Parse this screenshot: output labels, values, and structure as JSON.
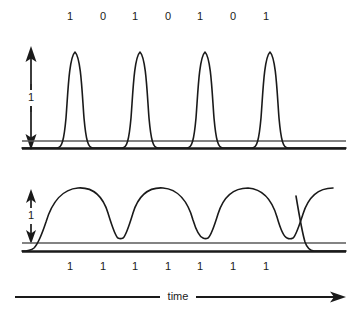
{
  "diagram": {
    "axis": {
      "time_label": "time",
      "time_arrow_icon": "right-arrow-icon"
    },
    "signals": [
      {
        "id": "upper",
        "name": "return-to-zero-waveform",
        "amplitude_label": "1",
        "amplitude_arrow_icon": "double-headed-vertical-arrow-icon",
        "bit_labels": [
          "1",
          "0",
          "1",
          "0",
          "1",
          "0",
          "1"
        ],
        "pulse_count": 4,
        "pulse_bit_indices": [
          0,
          2,
          4,
          6
        ],
        "baseline_lines": 2
      },
      {
        "id": "lower",
        "name": "non-return-to-zero-waveform",
        "amplitude_label": "1",
        "amplitude_arrow_icon": "double-headed-vertical-arrow-icon",
        "bit_labels": [
          "1",
          "1",
          "1",
          "1",
          "1",
          "1",
          "1"
        ],
        "hump_count": 4,
        "dip_count": 3,
        "baseline_lines": 2
      }
    ],
    "colors": {
      "stroke": "#1a1a1a",
      "baseline_thin": "#5a5a5a",
      "background": "#ffffff",
      "text": "#1a1a1a"
    },
    "geometry": {
      "bit_x_positions": [
        70,
        103,
        135,
        168,
        200,
        233,
        266
      ],
      "upper_bits_y": 17,
      "lower_bits_y": 267,
      "upper_baseline_thin_y": 141,
      "upper_baseline_thick_y": 148,
      "lower_baseline_thin_y": 243,
      "lower_baseline_thick_y": 251,
      "upper_peak_y": 51,
      "lower_peak_y": 189,
      "time_axis_y": 297,
      "time_axis_x_start": 15,
      "time_axis_x_end": 345,
      "time_label_x": 178
    }
  }
}
